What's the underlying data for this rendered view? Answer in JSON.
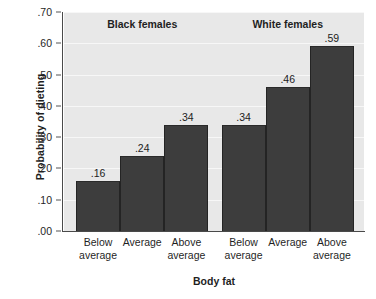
{
  "chart_data": {
    "type": "bar",
    "title": "",
    "xlabel": "Body fat",
    "ylabel": "Probability of dieting",
    "ylim": [
      0.0,
      0.7
    ],
    "ytick_labels": [
      ".70",
      ".60",
      ".50",
      ".40",
      ".30",
      ".20",
      ".10",
      ".00"
    ],
    "ytick_values": [
      0.7,
      0.6,
      0.5,
      0.4,
      0.3,
      0.2,
      0.1,
      0.0
    ],
    "grid": true,
    "legend": "none",
    "categories": [
      "Below average",
      "Average",
      "Above average"
    ],
    "category_lines": [
      [
        "Below",
        "average"
      ],
      [
        "Average",
        ""
      ],
      [
        "Above",
        "average"
      ]
    ],
    "groups": [
      {
        "name": "Black females",
        "values": [
          0.16,
          0.24,
          0.34
        ],
        "value_labels": [
          ".16",
          ".24",
          ".34"
        ]
      },
      {
        "name": "White females",
        "values": [
          0.34,
          0.46,
          0.59
        ],
        "value_labels": [
          ".34",
          ".46",
          ".59"
        ]
      }
    ],
    "colors": {
      "bar": "#3d3d3d",
      "bar_edge": "#242424",
      "plot_background": "#e8e8e8",
      "page_background": "#ffffff",
      "gridline": "#f7f7f7",
      "axis": "#4a4a4a",
      "text": "#1f1f1f"
    }
  }
}
